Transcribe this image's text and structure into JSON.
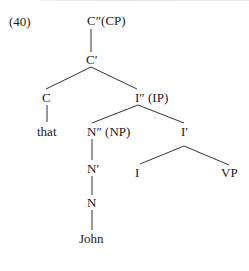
{
  "example_number": "(40)",
  "tree": {
    "nodes": {
      "cp": "C″(CP)",
      "c_bar": "C′",
      "c": "C",
      "that": "that",
      "ip": "I″ (IP)",
      "np": "N″ (NP)",
      "i_bar": "I′",
      "n_bar": "N′",
      "i": "I",
      "vp": "VP",
      "n": "N",
      "john": "John"
    },
    "edges": [
      [
        "cp",
        "c_bar"
      ],
      [
        "c_bar",
        "c"
      ],
      [
        "c_bar",
        "ip"
      ],
      [
        "c",
        "that"
      ],
      [
        "ip",
        "np"
      ],
      [
        "ip",
        "i_bar"
      ],
      [
        "np",
        "n_bar"
      ],
      [
        "n_bar",
        "n"
      ],
      [
        "n",
        "john"
      ],
      [
        "i_bar",
        "i"
      ],
      [
        "i_bar",
        "vp"
      ]
    ]
  }
}
